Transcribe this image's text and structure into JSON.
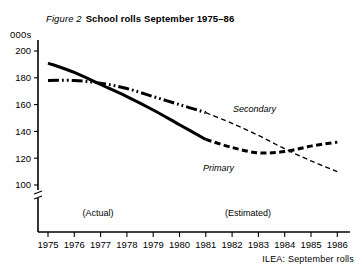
{
  "figure": {
    "number": "Figure 2",
    "title": "School rolls September 1975–86",
    "unit_label": "000s",
    "source": "ILEA:  September rolls"
  },
  "annotations": {
    "actual": "(Actual)",
    "estimated": "(Estimated)"
  },
  "chart_data": {
    "type": "line",
    "title": "School rolls September 1975–86",
    "xlabel": "",
    "ylabel": "000s",
    "ylim": [
      90,
      205
    ],
    "yticks": [
      100,
      120,
      140,
      160,
      180,
      200
    ],
    "ytick_labels": [
      "100",
      "120",
      "140",
      "160",
      "180",
      "200"
    ],
    "axis_break": true,
    "grid": false,
    "legend": "inline-labels",
    "x": [
      1975,
      1976,
      1977,
      1978,
      1979,
      1980,
      1981,
      1982,
      1983,
      1984,
      1985,
      1986
    ],
    "xtick_labels": [
      "1975",
      "1976",
      "1977",
      "1978",
      "1979",
      "1980",
      "1981",
      "1982",
      "1983",
      "1984",
      "1985",
      "1986"
    ],
    "actual_range": [
      1975,
      1981
    ],
    "estimated_range": [
      1981,
      1986
    ],
    "series": [
      {
        "name": "Primary",
        "label": "Primary",
        "style_actual": "solid-thick",
        "style_estimated": "dashed-thick",
        "values": [
          191,
          184,
          175,
          166,
          156,
          145,
          134,
          128,
          124,
          125,
          129,
          132
        ]
      },
      {
        "name": "Secondary",
        "label": "Secondary",
        "style_actual": "dash-dot-thick",
        "style_estimated": "dashed-thin",
        "values": [
          178,
          178,
          176,
          172,
          166,
          160,
          154,
          146,
          137,
          127,
          118,
          110
        ]
      }
    ]
  }
}
